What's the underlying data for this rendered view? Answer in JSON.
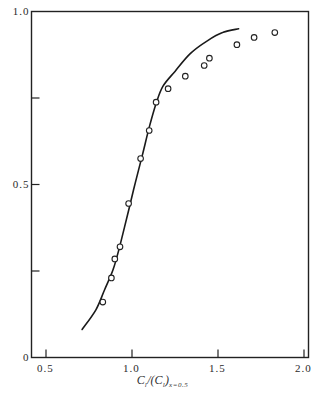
{
  "chart_data": {
    "type": "scatter",
    "title": "",
    "xlabel": "Cl/(Cl)x=0.5",
    "xlabel_parts": {
      "main": "C",
      "sub1": "l",
      "mid": "/(C",
      "sub2": "l",
      "close": ")",
      "sub3": "x=0.5"
    },
    "ylabel": "",
    "xlim": [
      0.42,
      2.0
    ],
    "ylim": [
      0,
      1.0
    ],
    "grid": false,
    "legend": null,
    "x_ticks": [
      {
        "value": 0.5,
        "label": "0.5"
      },
      {
        "value": 1.0,
        "label": "1.0"
      },
      {
        "value": 1.5,
        "label": "1.5"
      },
      {
        "value": 2.0,
        "label": "2.0"
      }
    ],
    "y_ticks": [
      {
        "value": 0,
        "label": "0"
      },
      {
        "value": 0.25,
        "label": ""
      },
      {
        "value": 0.5,
        "label": "0.5"
      },
      {
        "value": 0.75,
        "label": ""
      },
      {
        "value": 1.0,
        "label": "1.0"
      }
    ],
    "series": [
      {
        "name": "measured",
        "kind": "scatter",
        "marker": "open-circle",
        "x": [
          0.83,
          0.88,
          0.9,
          0.93,
          0.98,
          1.05,
          1.1,
          1.14,
          1.21,
          1.31,
          1.42,
          1.45,
          1.61,
          1.71,
          1.83
        ],
        "y": [
          0.16,
          0.23,
          0.285,
          0.32,
          0.445,
          0.575,
          0.656,
          0.738,
          0.777,
          0.813,
          0.844,
          0.865,
          0.904,
          0.925,
          0.939
        ]
      },
      {
        "name": "theory",
        "kind": "line",
        "x": [
          0.71,
          0.79,
          0.84,
          0.89,
          0.93,
          0.98,
          1.02,
          1.06,
          1.1,
          1.14,
          1.18,
          1.25,
          1.34,
          1.44,
          1.53,
          1.62
        ],
        "y": [
          0.081,
          0.138,
          0.195,
          0.254,
          0.324,
          0.425,
          0.506,
          0.584,
          0.665,
          0.734,
          0.784,
          0.827,
          0.879,
          0.916,
          0.94,
          0.95
        ]
      }
    ]
  }
}
